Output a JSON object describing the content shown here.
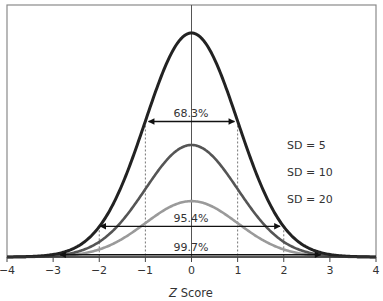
{
  "chart_data": {
    "type": "line",
    "title": "",
    "xlabel_italic": "Z",
    "xlabel_rest": " Score",
    "xlabel": "Z Score",
    "ylabel": "",
    "xlim": [
      -4,
      4
    ],
    "x_ticks": [
      -4,
      -3,
      -2,
      -1,
      0,
      1,
      2,
      3,
      4
    ],
    "x_tick_labels": [
      "−4",
      "−3",
      "−2",
      "−1",
      "0",
      "1",
      "2",
      "3",
      "4"
    ],
    "grid": false,
    "legend_position": "right",
    "series": [
      {
        "name": "SD = 5",
        "sd": 5,
        "peak_density": 0.0798,
        "color": "#222222",
        "width": 3
      },
      {
        "name": "SD = 10",
        "sd": 10,
        "peak_density": 0.0399,
        "color": "#555555",
        "width": 2.6
      },
      {
        "name": "SD = 20",
        "sd": 20,
        "peak_density": 0.0199,
        "color": "#9a9a9a",
        "width": 2.6
      }
    ],
    "annotations": [
      {
        "label": "68.3%",
        "from_z": -0.93,
        "to_z": 0.93,
        "arrow_y_frac": 0.605,
        "guide_z": [
          -1,
          1
        ]
      },
      {
        "label": "95.4%",
        "from_z": -1.98,
        "to_z": 1.92,
        "arrow_y_frac": 0.137,
        "guide_z": [
          -2,
          2
        ]
      },
      {
        "label": "99.7%",
        "from_z": -2.85,
        "to_z": 2.8,
        "arrow_y_frac": 0.01,
        "guide_z": []
      }
    ]
  },
  "legend": {
    "items": [
      "SD = 5",
      "SD = 10",
      "SD = 20"
    ]
  },
  "annotations": {
    "a68": "68.3%",
    "a95": "95.4%",
    "a99": "99.7%"
  },
  "axis": {
    "x_title_italic": "Z",
    "x_title_rest": " Score",
    "ticks": [
      "−4",
      "−3",
      "−2",
      "−1",
      "0",
      "1",
      "2",
      "3",
      "4"
    ]
  }
}
